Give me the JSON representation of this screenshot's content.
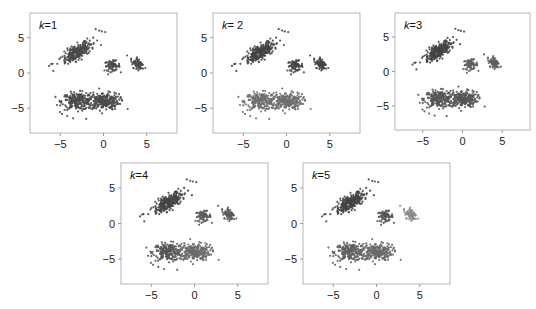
{
  "figure": {
    "panel_layout": [
      {
        "k_label": "k = 1",
        "k_var": "k",
        "k_value": "1",
        "box": [
          30,
          13,
          147,
          120
        ]
      },
      {
        "k_label": "k = 2",
        "k_var": "k",
        "k_value": " 2",
        "box": [
          213,
          13,
          147,
          120
        ]
      },
      {
        "k_label": "k = 3",
        "k_var": "k",
        "k_value": "3",
        "box": [
          395,
          13,
          135,
          117
        ]
      },
      {
        "k_label": "k = 4",
        "k_var": "k",
        "k_value": "4",
        "box": [
          121,
          163,
          147,
          121
        ]
      },
      {
        "k_label": "k = 5",
        "k_var": "k",
        "k_value": "5",
        "box": [
          303,
          163,
          147,
          121
        ]
      }
    ]
  },
  "chart_data": [
    {
      "type": "scatter",
      "title": "k=1",
      "xlabel": "",
      "ylabel": "",
      "xlim": [
        -8.5,
        8.5
      ],
      "ylim": [
        -8.5,
        8.5
      ],
      "xticks": [
        -5,
        0,
        5
      ],
      "yticks": [
        5,
        0,
        -5
      ],
      "xtick_labels": [
        "−5",
        "0",
        "5"
      ],
      "ytick_labels": [
        "5",
        "0",
        "−5"
      ],
      "grid": false,
      "clusters": [
        {
          "name": "upper-left elongated",
          "center": [
            -3,
            3
          ],
          "assigned_cluster": 1
        },
        {
          "name": "middle small",
          "center": [
            1,
            1
          ],
          "assigned_cluster": 1
        },
        {
          "name": "right small",
          "center": [
            4,
            1.2
          ],
          "assigned_cluster": 1
        },
        {
          "name": "bottom-left",
          "center": [
            -3,
            -4
          ],
          "assigned_cluster": 1
        },
        {
          "name": "bottom-right",
          "center": [
            0,
            -4
          ],
          "assigned_cluster": 1
        }
      ],
      "cluster_colors": [
        "#4a4a4a"
      ]
    },
    {
      "type": "scatter",
      "title": "k=2",
      "xlim": [
        -8.5,
        8.5
      ],
      "ylim": [
        -8.5,
        8.5
      ],
      "xticks": [
        -5,
        0,
        5
      ],
      "yticks": [
        5,
        0,
        -5
      ],
      "xtick_labels": [
        "−5",
        "0",
        "5"
      ],
      "ytick_labels": [
        "5",
        "0",
        "−5"
      ],
      "clusters": [
        {
          "name": "upper-left elongated",
          "center": [
            -3,
            3
          ],
          "assigned_cluster": 1
        },
        {
          "name": "middle small",
          "center": [
            1,
            1
          ],
          "assigned_cluster": 1
        },
        {
          "name": "right small",
          "center": [
            4,
            1.2
          ],
          "assigned_cluster": 1
        },
        {
          "name": "bottom-left",
          "center": [
            -3,
            -4
          ],
          "assigned_cluster": 2
        },
        {
          "name": "bottom-right",
          "center": [
            0,
            -4
          ],
          "assigned_cluster": 2
        }
      ],
      "cluster_colors": [
        "#444444",
        "#6e6e6e"
      ]
    },
    {
      "type": "scatter",
      "title": "k=3",
      "xlim": [
        -8.5,
        8.5
      ],
      "ylim": [
        -8.5,
        8.5
      ],
      "xticks": [
        -5,
        0,
        5
      ],
      "yticks": [
        5,
        0,
        -5
      ],
      "xtick_labels": [
        "−5",
        "0",
        "5"
      ],
      "ytick_labels": [
        "5",
        "0",
        "−5"
      ],
      "clusters": [
        {
          "name": "upper-left elongated",
          "center": [
            -3,
            3
          ],
          "assigned_cluster": 1
        },
        {
          "name": "middle small",
          "center": [
            1,
            1
          ],
          "assigned_cluster": 2
        },
        {
          "name": "right small",
          "center": [
            4,
            1.2
          ],
          "assigned_cluster": 2
        },
        {
          "name": "bottom-left",
          "center": [
            -3,
            -4
          ],
          "assigned_cluster": 3
        },
        {
          "name": "bottom-right",
          "center": [
            0,
            -4
          ],
          "assigned_cluster": 3
        }
      ],
      "cluster_colors": [
        "#444444",
        "#5e5e5e",
        "#555555"
      ]
    },
    {
      "type": "scatter",
      "title": "k=4",
      "xlim": [
        -8.5,
        8.5
      ],
      "ylim": [
        -8.5,
        8.5
      ],
      "xticks": [
        -5,
        0,
        5
      ],
      "yticks": [
        5,
        0,
        -5
      ],
      "xtick_labels": [
        "−5",
        "0",
        "5"
      ],
      "ytick_labels": [
        "5",
        "0",
        "−5"
      ],
      "clusters": [
        {
          "name": "upper-left elongated",
          "center": [
            -3,
            3
          ],
          "assigned_cluster": 1
        },
        {
          "name": "middle small",
          "center": [
            1,
            1
          ],
          "assigned_cluster": 2
        },
        {
          "name": "right small",
          "center": [
            4,
            1.2
          ],
          "assigned_cluster": 2
        },
        {
          "name": "bottom-left",
          "center": [
            -3,
            -4
          ],
          "assigned_cluster": 3
        },
        {
          "name": "bottom-right",
          "center": [
            0,
            -4
          ],
          "assigned_cluster": 4
        }
      ],
      "cluster_colors": [
        "#454545",
        "#5a5a5a",
        "#555555",
        "#6a6a6a"
      ]
    },
    {
      "type": "scatter",
      "title": "k=5",
      "xlim": [
        -8.5,
        8.5
      ],
      "ylim": [
        -8.5,
        8.5
      ],
      "xticks": [
        -5,
        0,
        5
      ],
      "yticks": [
        5,
        0,
        -5
      ],
      "xtick_labels": [
        "−5",
        "0",
        "5"
      ],
      "ytick_labels": [
        "5",
        "0",
        "−5"
      ],
      "clusters": [
        {
          "name": "upper-left elongated",
          "center": [
            -3,
            3
          ],
          "assigned_cluster": 1
        },
        {
          "name": "middle small",
          "center": [
            1,
            1
          ],
          "assigned_cluster": 2
        },
        {
          "name": "right small",
          "center": [
            4,
            1.2
          ],
          "assigned_cluster": 3
        },
        {
          "name": "bottom-left",
          "center": [
            -3,
            -4
          ],
          "assigned_cluster": 4
        },
        {
          "name": "bottom-right",
          "center": [
            0,
            -4
          ],
          "assigned_cluster": 5
        }
      ],
      "cluster_colors": [
        "#444444",
        "#555555",
        "#8a8a8a",
        "#5f5f5f",
        "#6a6a6a"
      ]
    }
  ],
  "generator": {
    "blobs": [
      {
        "cx": -3.0,
        "cy": 3.0,
        "sx": 1.0,
        "sy": 0.45,
        "angle_deg": 38,
        "n": 260
      },
      {
        "cx": 1.0,
        "cy": 1.0,
        "sx": 0.45,
        "sy": 0.35,
        "angle_deg": 0,
        "n": 70
      },
      {
        "cx": 4.0,
        "cy": 1.2,
        "sx": 0.35,
        "sy": 0.55,
        "angle_deg": 40,
        "n": 70
      },
      {
        "cx": -3.0,
        "cy": -4.0,
        "sx": 0.9,
        "sy": 0.6,
        "angle_deg": 0,
        "n": 220
      },
      {
        "cx": 0.0,
        "cy": -4.0,
        "sx": 0.9,
        "sy": 0.6,
        "angle_deg": 0,
        "n": 240
      }
    ],
    "outliers": [
      [
        -0.9,
        6.2
      ],
      [
        -0.5,
        6.0
      ],
      [
        -0.2,
        5.9
      ],
      [
        0.2,
        5.8
      ],
      [
        -1.2,
        5.0
      ],
      [
        -5.8,
        0.3
      ],
      [
        -6.3,
        1.0
      ],
      [
        -5.9,
        1.3
      ],
      [
        2.8,
        -5.1
      ],
      [
        1.8,
        -3.0
      ],
      [
        -0.5,
        -2.2
      ],
      [
        1.5,
        0.5
      ],
      [
        -4.8,
        -5.8
      ],
      [
        -2.0,
        -6.5
      ],
      [
        -4.2,
        -6.1
      ]
    ],
    "outlier_blob": [
      0,
      0,
      0,
      0,
      0,
      0,
      0,
      0,
      4,
      4,
      4,
      1,
      3,
      3,
      3
    ]
  },
  "style": {
    "axis_color": "#9a9a9a",
    "point_radius": 1.1
  }
}
